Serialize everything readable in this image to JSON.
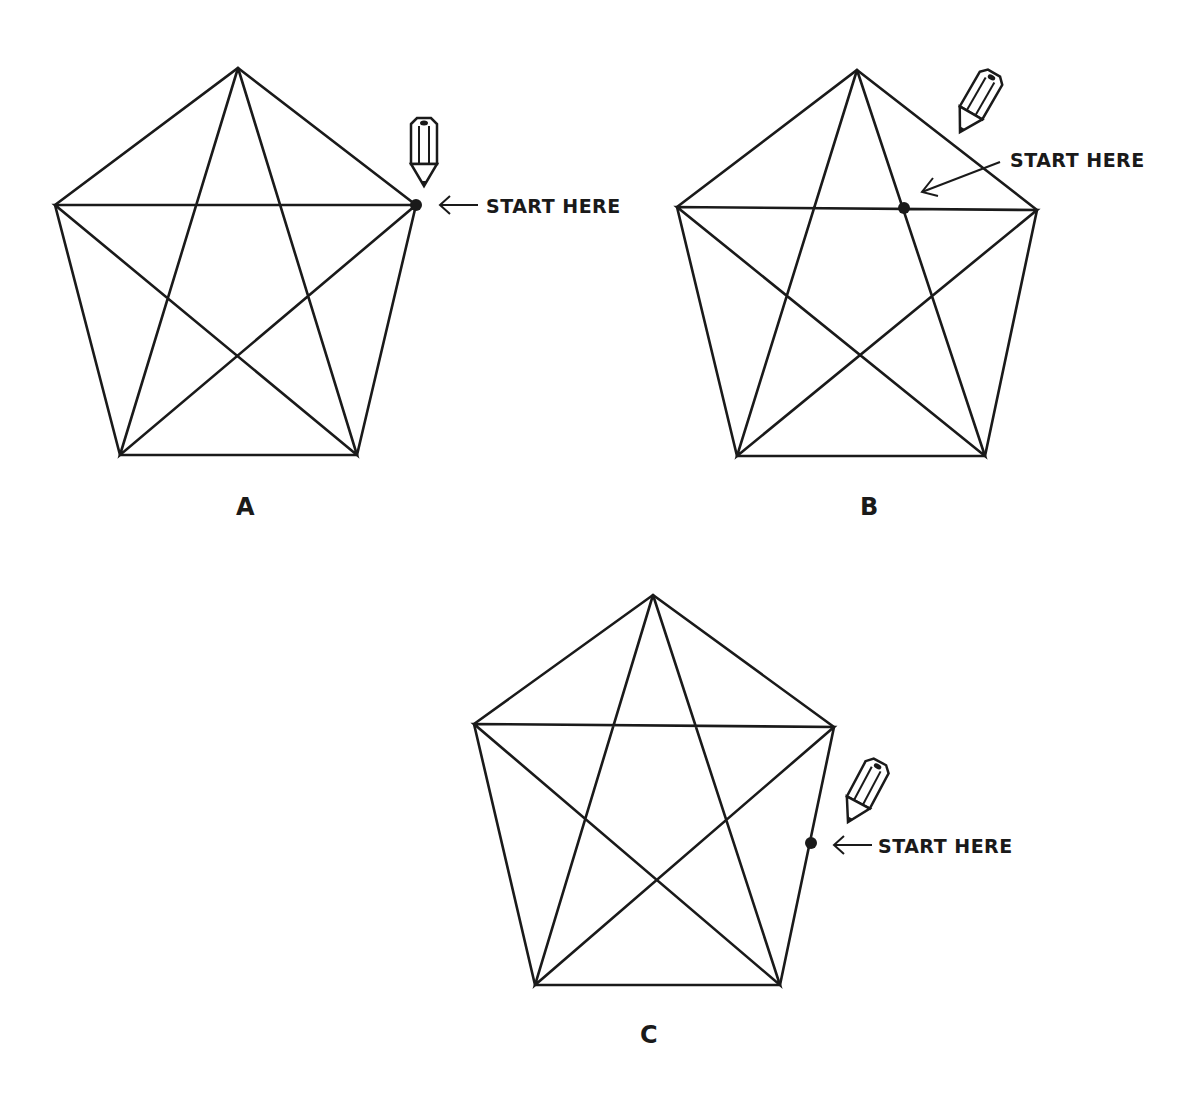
{
  "figures": [
    {
      "id": "A",
      "label": "A",
      "start_label": "START HERE",
      "vertices": {
        "top": [
          238,
          68
        ],
        "left": [
          55,
          205
        ],
        "right": [
          416,
          205
        ],
        "bottom_left": [
          120,
          455
        ],
        "bottom_right": [
          357,
          455
        ]
      },
      "start_point": [
        416,
        205
      ],
      "start_position": "right vertex"
    },
    {
      "id": "B",
      "label": "B",
      "start_label": "START HERE",
      "vertices": {
        "top": [
          857,
          70
        ],
        "left": [
          677,
          207
        ],
        "right": [
          1037,
          210
        ],
        "bottom_left": [
          737,
          456
        ],
        "bottom_right": [
          985,
          456
        ]
      },
      "start_point": [
        904,
        208
      ],
      "start_position": "intersection on horizontal diagonal"
    },
    {
      "id": "C",
      "label": "C",
      "start_label": "START HERE",
      "vertices": {
        "top": [
          653,
          595
        ],
        "left": [
          474,
          724
        ],
        "right": [
          834,
          727
        ],
        "bottom_left": [
          535,
          985
        ],
        "bottom_right": [
          780,
          985
        ]
      },
      "start_point": [
        811,
        843
      ],
      "start_position": "midpoint of right edge"
    }
  ],
  "colors": {
    "ink": "#1a1a1a",
    "background": "#ffffff"
  },
  "icons": [
    "pencil-icon",
    "arrow-left-icon"
  ]
}
